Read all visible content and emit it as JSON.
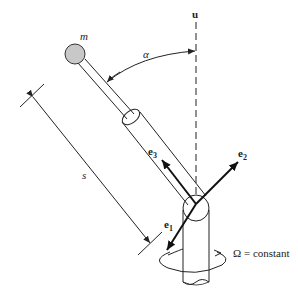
{
  "figure": {
    "labels": {
      "mass": "m",
      "axis_u": "u",
      "angle": "α",
      "length": "s",
      "e1": "e",
      "e1_sub": "1",
      "e2": "e",
      "e2_sub": "2",
      "e3": "e",
      "e3_sub": "3",
      "omega": "Ω = constant"
    },
    "colors": {
      "line": "#222222",
      "mass_fill": "#c8c8c8"
    }
  }
}
